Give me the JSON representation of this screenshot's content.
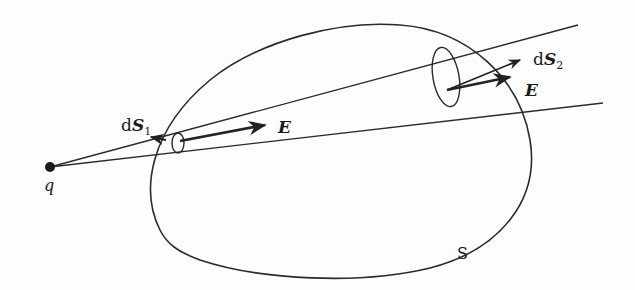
{
  "diagram": {
    "labels": {
      "charge": "q",
      "surface": "S",
      "area1_prefix": "d",
      "area1_vec": "S",
      "area1_sub": "1",
      "area2_prefix": "d",
      "area2_vec": "S",
      "area2_sub": "2",
      "field1": "E",
      "field2": "E"
    },
    "colors": {
      "stroke": "#2a2a2a",
      "background": "#fdfdfd"
    }
  }
}
